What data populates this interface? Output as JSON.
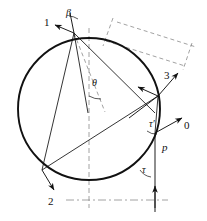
{
  "figure": {
    "type": "geometric-diagram",
    "background_color": "#ffffff",
    "stroke_color": "#111111",
    "dash_color": "#8a8a8a",
    "canvas": {
      "width": 207,
      "height": 221
    },
    "circle": {
      "cx": 89,
      "cy": 109,
      "r": 71
    }
  },
  "labels": {
    "ray_one": "1",
    "ray_two": "2",
    "ray_three": "3",
    "ray_zero": "0",
    "angle_beta": "β",
    "angle_theta": "θ",
    "angle_tau": "τ",
    "angle_tau_prime": "τ′",
    "point_p": "p"
  },
  "label_positions": {
    "ray_one": {
      "x": 44,
      "y": 22
    },
    "ray_two": {
      "x": 48,
      "y": 197
    },
    "ray_three": {
      "x": 164,
      "y": 74
    },
    "ray_zero": {
      "x": 184,
      "y": 126
    },
    "angle_beta": {
      "x": 65,
      "y": 10
    },
    "angle_theta": {
      "x": 93,
      "y": 81
    },
    "angle_tau": {
      "x": 143,
      "y": 168
    },
    "angle_tau_prime": {
      "x": 150,
      "y": 122
    },
    "point_p": {
      "x": 163,
      "y": 146
    }
  },
  "icon_names": {
    "circle": "circle-outline-icon",
    "arrow": "arrow-head-icon",
    "dashed": "dashed-construction-line-icon"
  }
}
